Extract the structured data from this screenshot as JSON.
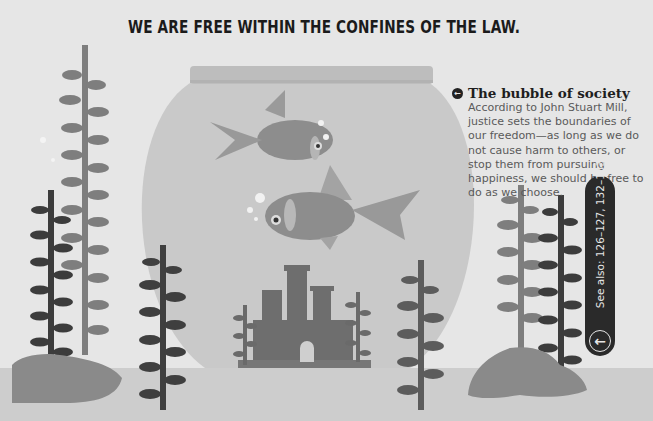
{
  "page": {
    "headline": "WE ARE FREE WITHIN THE CONFINES OF THE LAW.",
    "caption": {
      "bullet_icon": "arrow-left-circle-icon",
      "bullet_glyph": "←",
      "title": "The bubble of society",
      "body": "According to John Stuart Mill, justice sets the boundaries of our freedom—as long as we do not cause harm to others, or stop them from pursuing happiness, we should be free to do as we choose."
    },
    "see_also": {
      "label": "See also: 126–127, 132–133",
      "arrow_glyph": "←",
      "arrow_icon": "arrow-left-circle-icon"
    }
  },
  "illustration": {
    "subject": "goldfish bowl with two goldfish, castle and seaweed",
    "colors": {
      "background": "#e6e6e6",
      "floor": "#cdcdcd",
      "bowl": "#c9c9c9",
      "bowl_rim": "#bdbdbd",
      "fish": "#8d8d8d",
      "seaweed_light": "#7e7e7e",
      "seaweed_dark": "#3c3c3c",
      "rock": "#8a8a8a",
      "castle": "#6e6e6e",
      "tab": "#2a2a2a"
    }
  }
}
